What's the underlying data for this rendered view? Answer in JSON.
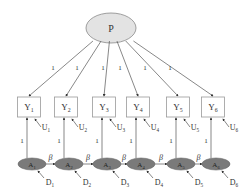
{
  "diagram": {
    "type": "structural-equation-model",
    "latent_factor": {
      "label": "P",
      "fill": "#e3e3e3"
    },
    "loading_label": "1",
    "indicators": [
      {
        "label": "Y",
        "sub": "1",
        "error": "U",
        "error_sub": "1"
      },
      {
        "label": "Y",
        "sub": "2",
        "error": "U",
        "error_sub": "2"
      },
      {
        "label": "Y",
        "sub": "3",
        "error": "U",
        "error_sub": "3"
      },
      {
        "label": "Y",
        "sub": "4",
        "error": "U",
        "error_sub": "4"
      },
      {
        "label": "Y",
        "sub": "5",
        "error": "U",
        "error_sub": "5"
      },
      {
        "label": "Y",
        "sub": "6",
        "error": "U",
        "error_sub": "6"
      }
    ],
    "autoregressive": [
      {
        "label": "A",
        "sub": "1",
        "disturbance": "D",
        "dist_sub": "1"
      },
      {
        "label": "A",
        "sub": "2",
        "disturbance": "D",
        "dist_sub": "2"
      },
      {
        "label": "A",
        "sub": "3",
        "disturbance": "D",
        "dist_sub": "3"
      },
      {
        "label": "A",
        "sub": "4",
        "disturbance": "D",
        "dist_sub": "4"
      },
      {
        "label": "A",
        "sub": "5",
        "disturbance": "D",
        "dist_sub": "5"
      },
      {
        "label": "A",
        "sub": "6",
        "disturbance": "D",
        "dist_sub": "6"
      }
    ],
    "ar_path_label": "β",
    "ar_fill": "#7a7a7a"
  }
}
